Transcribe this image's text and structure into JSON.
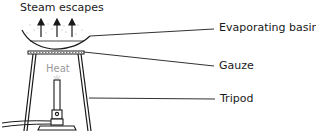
{
  "diagram": {
    "title_label": "Steam escapes",
    "heat_label": "Heat",
    "labels": [
      {
        "id": "basin",
        "text": "Evaporating basin"
      },
      {
        "id": "gauze",
        "text": "Gauze"
      },
      {
        "id": "tripod",
        "text": "Tripod"
      }
    ],
    "colors": {
      "line": "#1a1a1a",
      "heat_text": "#9a9a9a",
      "steam": "#bdbdbd"
    }
  }
}
